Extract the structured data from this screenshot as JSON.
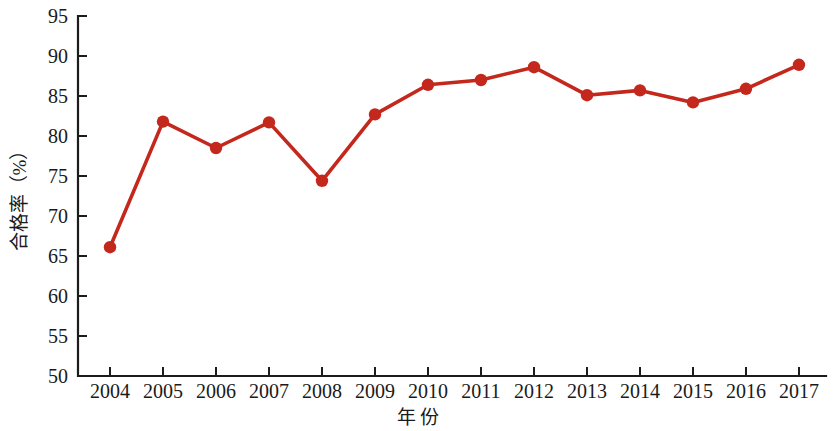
{
  "chart_data": {
    "type": "line",
    "title": "",
    "xlabel": "年  份",
    "ylabel": "合格率（%）",
    "categories": [
      "2004",
      "2005",
      "2006",
      "2007",
      "2008",
      "2009",
      "2010",
      "2011",
      "2012",
      "2013",
      "2014",
      "2015",
      "2016",
      "2017"
    ],
    "values": [
      66.1,
      81.8,
      78.5,
      81.7,
      74.4,
      82.7,
      86.4,
      87.0,
      88.6,
      85.1,
      85.7,
      84.2,
      85.9,
      88.9
    ],
    "series": [
      {
        "name": "合格率",
        "values": [
          66.1,
          81.8,
          78.5,
          81.7,
          74.4,
          82.7,
          86.4,
          87.0,
          88.6,
          85.1,
          85.7,
          84.2,
          85.9,
          88.9
        ],
        "color": "#C4281C"
      }
    ],
    "ylim": [
      50,
      95
    ],
    "yticks": [
      50,
      55,
      60,
      65,
      70,
      75,
      80,
      85,
      90,
      95
    ],
    "ytick_labels": [
      "50",
      "55",
      "60",
      "65",
      "70",
      "75",
      "80",
      "85",
      "90",
      "95"
    ],
    "xtick_labels": [
      "2004",
      "2005",
      "2006",
      "2007",
      "2008",
      "2009",
      "2010",
      "2011",
      "2012",
      "2013",
      "2014",
      "2015",
      "2016",
      "2017"
    ],
    "grid": false,
    "legend": false,
    "legend_position": "none",
    "marker": "circle",
    "line_color": "#C4281C",
    "axis_color": "#1C1C1C",
    "background_color": "#FFFFFF"
  },
  "labels": {
    "y_axis_title": "合格率（%）",
    "x_axis_title": "年  份"
  }
}
